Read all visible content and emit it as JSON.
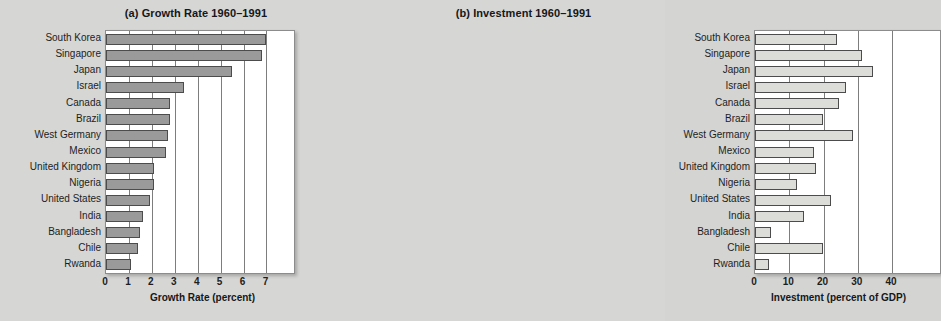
{
  "figure": {
    "background_color": "#d6d6d4",
    "panel_background": "#ffffff"
  },
  "chart_data": [
    {
      "type": "bar",
      "orientation": "horizontal",
      "panel_label": "(a)",
      "title": "(a) Growth Rate 1960–1991",
      "xlabel": "Growth Rate (percent)",
      "ylabel": "",
      "xlim": [
        0,
        8.2
      ],
      "ylim": [
        0,
        15
      ],
      "xticks": [
        0,
        1,
        2,
        3,
        4,
        5,
        6,
        7
      ],
      "xticklabels": [
        "0",
        "1",
        "2",
        "3",
        "4",
        "5",
        "6",
        "7"
      ],
      "grid": "vertical",
      "legend": "none",
      "bar_color": "#9a9a9a",
      "bar_edge_color": "#4c4c4c",
      "categories": [
        "South Korea",
        "Singapore",
        "Japan",
        "Israel",
        "Canada",
        "Brazil",
        "West Germany",
        "Mexico",
        "United Kingdom",
        "Nigeria",
        "United States",
        "India",
        "Bangladesh",
        "Chile",
        "Rwanda"
      ],
      "values": [
        7.0,
        6.8,
        5.5,
        3.4,
        2.8,
        2.8,
        2.7,
        2.6,
        2.1,
        2.1,
        1.9,
        1.6,
        1.5,
        1.4,
        1.1
      ]
    },
    {
      "type": "bar",
      "orientation": "horizontal",
      "panel_label": "(b)",
      "title": "(b) Investment 1960–1991",
      "xlabel": "Investment (percent of GDP)",
      "ylabel": "",
      "xlim": [
        0,
        54
      ],
      "ylim": [
        0,
        15
      ],
      "xticks": [
        0,
        10,
        20,
        30,
        40
      ],
      "xticklabels": [
        "0",
        "10",
        "20",
        "30",
        "40"
      ],
      "grid": "vertical",
      "legend": "none",
      "bar_color": "#dcdcd8",
      "bar_edge_color": "#4c4c4c",
      "categories": [
        "South Korea",
        "Singapore",
        "Japan",
        "Israel",
        "Canada",
        "Brazil",
        "West Germany",
        "Mexico",
        "United Kingdom",
        "Nigeria",
        "United States",
        "India",
        "Bangladesh",
        "Chile",
        "Rwanda"
      ],
      "values": [
        24.0,
        31.3,
        34.5,
        26.5,
        24.6,
        19.8,
        28.7,
        17.1,
        17.9,
        12.4,
        22.2,
        14.3,
        4.6,
        19.8,
        4.1
      ]
    }
  ]
}
